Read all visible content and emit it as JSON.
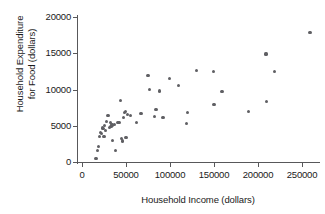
{
  "chart_data": {
    "type": "scatter",
    "title": "",
    "xlabel": "Household Income (dollars)",
    "ylabel_line1": "Household Expenditure",
    "ylabel_line2": "for Food (dollars)",
    "ylabel": "Household Expenditure for Food (dollars)",
    "xlim": [
      0,
      270000
    ],
    "ylim": [
      0,
      20000
    ],
    "xticks": [
      0,
      50000,
      100000,
      150000,
      200000,
      250000
    ],
    "xtick_labels": [
      "0",
      "50000",
      "100000",
      "150000",
      "200000",
      "250000"
    ],
    "yticks": [
      0,
      5000,
      10000,
      15000,
      20000
    ],
    "ytick_labels": [
      "0",
      "5000",
      "10000",
      "15000",
      "20000"
    ],
    "grid": false,
    "legend": null,
    "marker_color": "#5f5f63",
    "axis_color": "#58585a",
    "n_points": 52,
    "points": [
      {
        "x": 16000,
        "y": 500
      },
      {
        "x": 18000,
        "y": 1600
      },
      {
        "x": 19000,
        "y": 2100
      },
      {
        "x": 20000,
        "y": 3500
      },
      {
        "x": 21000,
        "y": 4100
      },
      {
        "x": 22000,
        "y": 3900
      },
      {
        "x": 23000,
        "y": 4700
      },
      {
        "x": 24000,
        "y": 4600
      },
      {
        "x": 25000,
        "y": 3500
      },
      {
        "x": 26000,
        "y": 5000
      },
      {
        "x": 27000,
        "y": 4400
      },
      {
        "x": 28000,
        "y": 5600
      },
      {
        "x": 29000,
        "y": 6400
      },
      {
        "x": 30000,
        "y": 6400
      },
      {
        "x": 31000,
        "y": 4800
      },
      {
        "x": 32000,
        "y": 5400
      },
      {
        "x": 33000,
        "y": 4900
      },
      {
        "x": 34000,
        "y": 5100
      },
      {
        "x": 35000,
        "y": 3000
      },
      {
        "x": 37000,
        "y": 5200
      },
      {
        "x": 38000,
        "y": 1600
      },
      {
        "x": 40000,
        "y": 5500
      },
      {
        "x": 42000,
        "y": 5400
      },
      {
        "x": 44000,
        "y": 8500
      },
      {
        "x": 45000,
        "y": 3200
      },
      {
        "x": 46000,
        "y": 2900
      },
      {
        "x": 47000,
        "y": 6100
      },
      {
        "x": 48000,
        "y": 6800
      },
      {
        "x": 49000,
        "y": 7000
      },
      {
        "x": 50000,
        "y": 3400
      },
      {
        "x": 52000,
        "y": 6500
      },
      {
        "x": 55000,
        "y": 6400
      },
      {
        "x": 62000,
        "y": 5400
      },
      {
        "x": 67000,
        "y": 6700
      },
      {
        "x": 75000,
        "y": 11900
      },
      {
        "x": 77000,
        "y": 10000
      },
      {
        "x": 82000,
        "y": 6300
      },
      {
        "x": 84000,
        "y": 7200
      },
      {
        "x": 88000,
        "y": 9800
      },
      {
        "x": 92000,
        "y": 6100
      },
      {
        "x": 99000,
        "y": 11500
      },
      {
        "x": 110000,
        "y": 10500
      },
      {
        "x": 119000,
        "y": 5300
      },
      {
        "x": 120000,
        "y": 6800
      },
      {
        "x": 130000,
        "y": 12600
      },
      {
        "x": 149000,
        "y": 12500
      },
      {
        "x": 150000,
        "y": 7900
      },
      {
        "x": 159000,
        "y": 9700
      },
      {
        "x": 189000,
        "y": 7000
      },
      {
        "x": 209000,
        "y": 14900
      },
      {
        "x": 210000,
        "y": 8300
      },
      {
        "x": 219000,
        "y": 12500
      },
      {
        "x": 259000,
        "y": 17900
      }
    ]
  }
}
